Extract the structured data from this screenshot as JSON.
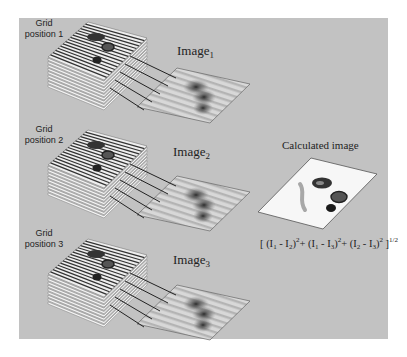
{
  "figure": {
    "domain": "multi-grid structured illumination diagram",
    "background_color": "#c2c2c2",
    "grid_positions": [
      {
        "label_line1": "Grid",
        "label_line2": "position 1",
        "image_label": "Image",
        "image_subscript": "1"
      },
      {
        "label_line1": "Grid",
        "label_line2": "position 2",
        "image_label": "Image",
        "image_subscript": "2"
      },
      {
        "label_line1": "Grid",
        "label_line2": "position 3",
        "image_label": "Image",
        "image_subscript": "3"
      }
    ],
    "calculated": {
      "title": "Calculated image",
      "formula": {
        "open": "[ ",
        "t1a": "(I",
        "t1a_sub": "1",
        "t1b": " - I",
        "t1b_sub": "2",
        "t1c": ")",
        "t1_sup": "2",
        "plus1": "+ ",
        "t2a": "(I",
        "t2a_sub": "1",
        "t2b": " - I",
        "t2b_sub": "3",
        "t2c": ")",
        "t2_sup": "2",
        "plus2": "+ ",
        "t3a": "(I",
        "t3a_sub": "2",
        "t3b": " - I",
        "t3b_sub": "3",
        "t3c": ")",
        "t3_sup": "2",
        "close": " ]",
        "power": "1/2"
      }
    }
  }
}
